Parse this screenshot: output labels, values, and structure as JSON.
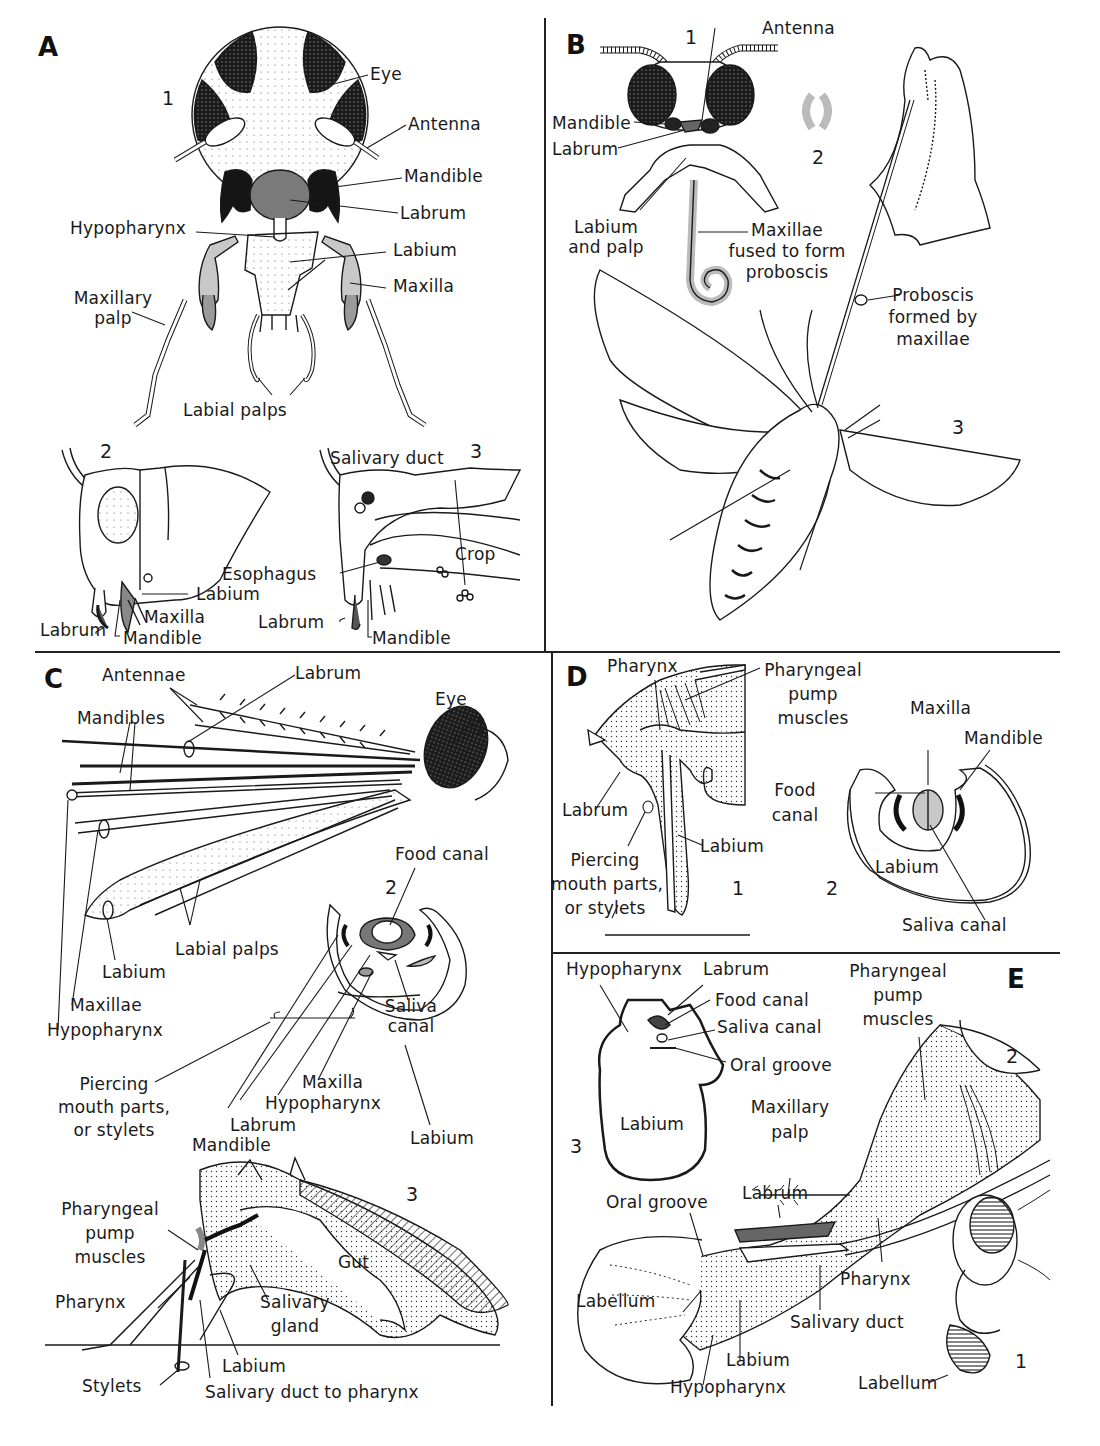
{
  "figure": {
    "colors": {
      "ink": "#1a1a1a",
      "shade_gray": "#8a8a8a",
      "light_gray": "#cfcfcf",
      "dark_fill": "#222222"
    }
  },
  "panels": {
    "A": {
      "letter": "A",
      "views": [
        "1",
        "2",
        "3"
      ],
      "view1_labels": {
        "eye": "Eye",
        "antenna": "Antenna",
        "mandible": "Mandible",
        "labrum": "Labrum",
        "hypopharynx": "Hypopharynx",
        "labium": "Labium",
        "maxilla": "Maxilla",
        "maxillary_palp_1": "Maxillary",
        "maxillary_palp_2": "palp",
        "labial_palps": "Labial palps"
      },
      "view2_labels": {
        "labium": "Labium",
        "maxilla": "Maxilla",
        "labrum": "Labrum",
        "mandible": "Mandible"
      },
      "view3_labels": {
        "salivary_duct": "Salivary duct",
        "crop": "Crop",
        "esophagus": "Esophagus",
        "labrum": "Labrum",
        "mandible": "Mandible"
      }
    },
    "B": {
      "letter": "B",
      "views": [
        "1",
        "2",
        "3"
      ],
      "labels": {
        "antenna": "Antenna",
        "mandible": "Mandible",
        "labrum": "Labrum",
        "labium_palp_1": "Labium",
        "labium_palp_2": "and palp",
        "maxillae_fused_1": "Maxillae",
        "maxillae_fused_2": "fused to form",
        "maxillae_fused_3": "proboscis",
        "proboscis_1": "Proboscis",
        "proboscis_2": "formed by",
        "proboscis_3": "maxillae"
      }
    },
    "C": {
      "letter": "C",
      "views": [
        "1",
        "2",
        "3"
      ],
      "view1_labels": {
        "antennae": "Antennae",
        "labrum": "Labrum",
        "eye": "Eye",
        "mandibles": "Mandibles",
        "labium": "Labium",
        "maxillae": "Maxillae",
        "hypopharynx": "Hypopharynx",
        "labial_palps": "Labial palps"
      },
      "view2_labels": {
        "food_canal": "Food canal",
        "saliva_canal_1": "Saliva",
        "saliva_canal_2": "canal",
        "piercing_1": "Piercing",
        "piercing_2": "mouth parts,",
        "piercing_3": "or stylets",
        "maxilla": "Maxilla",
        "hypopharynx": "Hypopharynx",
        "labrum": "Labrum",
        "mandible": "Mandible",
        "labium": "Labium"
      },
      "view3_labels": {
        "pump_1": "Pharyngeal",
        "pump_2": "pump",
        "pump_3": "muscles",
        "gut": "Gut",
        "pharynx": "Pharynx",
        "salivary_gland_1": "Salivary",
        "salivary_gland_2": "gland",
        "labium": "Labium",
        "stylets": "Stylets",
        "salivary_duct": "Salivary duct to pharynx"
      }
    },
    "D": {
      "letter": "D",
      "views": [
        "1",
        "2"
      ],
      "view1_labels": {
        "pharynx": "Pharynx",
        "pump_1": "Pharyngeal",
        "pump_2": "pump",
        "pump_3": "muscles",
        "labrum": "Labrum",
        "labium": "Labium",
        "piercing_1": "Piercing",
        "piercing_2": "mouth parts,",
        "piercing_3": "or stylets"
      },
      "view2_labels": {
        "maxilla": "Maxilla",
        "mandible": "Mandible",
        "food_canal_1": "Food",
        "food_canal_2": "canal",
        "labium": "Labium",
        "saliva_canal": "Saliva canal"
      }
    },
    "E": {
      "letter": "E",
      "views": [
        "1",
        "2",
        "3"
      ],
      "view3_labels": {
        "hypopharynx": "Hypopharynx",
        "labrum": "Labrum",
        "food_canal": "Food canal",
        "saliva_canal": "Saliva canal",
        "oral_groove": "Oral groove",
        "labium": "Labium"
      },
      "view2_labels": {
        "pump_1": "Pharyngeal",
        "pump_2": "pump",
        "pump_3": "muscles",
        "maxillary_palp_1": "Maxillary",
        "maxillary_palp_2": "palp",
        "labrum": "Labrum",
        "oral_groove": "Oral groove",
        "pharynx": "Pharynx",
        "labellum": "Labellum",
        "salivary_duct": "Salivary duct",
        "labium": "Labium",
        "hypopharynx": "Hypopharynx"
      },
      "view1_labels": {
        "labellum": "Labellum"
      }
    }
  }
}
